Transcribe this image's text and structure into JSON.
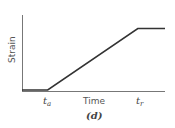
{
  "chart_data": {
    "type": "line",
    "title": "",
    "caption": "(d)",
    "xlabel": "Time",
    "ylabel": "Strain",
    "x_ticks": [
      {
        "label": "t",
        "sub": "a",
        "x": 0.18
      },
      {
        "label": "t",
        "sub": "r",
        "x": 0.81
      }
    ],
    "series": [
      {
        "name": "strain",
        "points": [
          [
            0,
            0
          ],
          [
            0.18,
            0
          ],
          [
            0.81,
            0.82
          ],
          [
            1.0,
            0.82
          ]
        ]
      }
    ],
    "grid": false,
    "legend": null
  }
}
